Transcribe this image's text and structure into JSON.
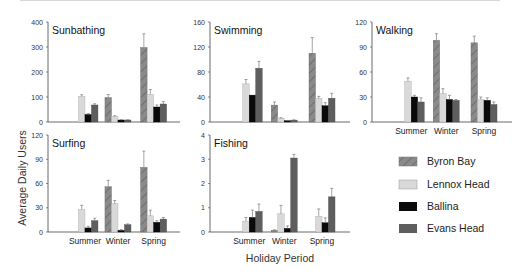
{
  "figure": {
    "ylabel": "Average Daily Users",
    "xlabel": "Holiday Period"
  },
  "legend": [
    {
      "label": "Byron Bay",
      "color": "#8a8a8a",
      "pattern": "hatch"
    },
    {
      "label": "Lennox Head",
      "color": "#d9d9d9",
      "pattern": "solid"
    },
    {
      "label": "Ballina",
      "color": "#0a0a0a",
      "pattern": "solid"
    },
    {
      "label": "Evans Head",
      "color": "#5e5e5e",
      "pattern": "solid"
    }
  ],
  "chart_data": [
    {
      "type": "bar",
      "title": "Sunbathing",
      "xlabel": "Holiday Period",
      "ylabel": "Average Daily Users",
      "categories": [
        "Summer",
        "Winter",
        "Spring"
      ],
      "ylim": [
        0,
        400
      ],
      "yticks": [
        0,
        100,
        200,
        300,
        400
      ],
      "show_xticklabels": false,
      "series": [
        {
          "name": "Byron Bay",
          "values": [
            null,
            98,
            298
          ],
          "errors": [
            null,
            12,
            55
          ]
        },
        {
          "name": "Lennox Head",
          "values": [
            103,
            22,
            110
          ],
          "errors": [
            6,
            3,
            20
          ]
        },
        {
          "name": "Ballina",
          "values": [
            30,
            8,
            60
          ],
          "errors": [
            4,
            1,
            8
          ]
        },
        {
          "name": "Evans Head",
          "values": [
            68,
            8,
            72
          ],
          "errors": [
            5,
            1,
            10
          ]
        }
      ]
    },
    {
      "type": "bar",
      "title": "Swimming",
      "xlabel": "Holiday Period",
      "ylabel": "Average Daily Users",
      "categories": [
        "Summer",
        "Winter",
        "Spring"
      ],
      "ylim": [
        0,
        160
      ],
      "yticks": [
        0,
        40,
        80,
        120,
        160
      ],
      "show_xticklabels": false,
      "series": [
        {
          "name": "Byron Bay",
          "values": [
            null,
            27,
            110
          ],
          "errors": [
            null,
            5,
            25
          ]
        },
        {
          "name": "Lennox Head",
          "values": [
            61,
            6,
            38
          ],
          "errors": [
            7,
            1,
            3
          ]
        },
        {
          "name": "Ballina",
          "values": [
            43,
            2,
            26
          ],
          "errors": [
            0,
            0.5,
            5
          ]
        },
        {
          "name": "Evans Head",
          "values": [
            86,
            3,
            38
          ],
          "errors": [
            11,
            0.5,
            8
          ]
        }
      ]
    },
    {
      "type": "bar",
      "title": "Walking",
      "xlabel": "Holiday Period",
      "ylabel": "Average Daily Users",
      "categories": [
        "Summer",
        "Winter",
        "Spring"
      ],
      "ylim": [
        0,
        120
      ],
      "yticks": [
        0,
        30,
        60,
        90,
        120
      ],
      "show_xticklabels": true,
      "series": [
        {
          "name": "Byron Bay",
          "values": [
            null,
            98,
            95
          ],
          "errors": [
            null,
            8,
            8
          ]
        },
        {
          "name": "Lennox Head",
          "values": [
            49,
            34,
            27
          ],
          "errors": [
            4,
            6,
            3
          ]
        },
        {
          "name": "Ballina",
          "values": [
            30,
            27,
            26
          ],
          "errors": [
            2,
            5,
            3
          ]
        },
        {
          "name": "Evans Head",
          "values": [
            24,
            26,
            21
          ],
          "errors": [
            5,
            1,
            3
          ]
        }
      ]
    },
    {
      "type": "bar",
      "title": "Surfing",
      "xlabel": "Holiday Period",
      "ylabel": "Average Daily Users",
      "categories": [
        "Summer",
        "Winter",
        "Spring"
      ],
      "ylim": [
        0,
        120
      ],
      "yticks": [
        0,
        30,
        60,
        90,
        120
      ],
      "show_xticklabels": true,
      "series": [
        {
          "name": "Byron Bay",
          "values": [
            null,
            56,
            80
          ],
          "errors": [
            null,
            8,
            20
          ]
        },
        {
          "name": "Lennox Head",
          "values": [
            28,
            35,
            20
          ],
          "errors": [
            5,
            4,
            7
          ]
        },
        {
          "name": "Ballina",
          "values": [
            5,
            2,
            12
          ],
          "errors": [
            2,
            1,
            2
          ]
        },
        {
          "name": "Evans Head",
          "values": [
            14,
            9,
            16
          ],
          "errors": [
            3,
            1,
            2
          ]
        }
      ]
    },
    {
      "type": "bar",
      "title": "Fishing",
      "xlabel": "Holiday Period",
      "ylabel": "Average Daily Users",
      "categories": [
        "Summer",
        "Winter",
        "Spring"
      ],
      "ylim": [
        0,
        4
      ],
      "yticks": [
        0,
        1,
        2,
        3,
        4
      ],
      "show_xticklabels": true,
      "series": [
        {
          "name": "Byron Bay",
          "values": [
            null,
            0.07,
            null
          ],
          "errors": [
            null,
            0.02,
            null
          ]
        },
        {
          "name": "Lennox Head",
          "values": [
            0.45,
            0.75,
            0.65
          ],
          "errors": [
            0.15,
            0.35,
            0.3
          ]
        },
        {
          "name": "Ballina",
          "values": [
            0.6,
            0.15,
            0.38
          ],
          "errors": [
            0.3,
            0.1,
            0.2
          ]
        },
        {
          "name": "Evans Head",
          "values": [
            0.85,
            3.05,
            1.45
          ],
          "errors": [
            0.3,
            0.15,
            0.35
          ]
        }
      ]
    }
  ]
}
